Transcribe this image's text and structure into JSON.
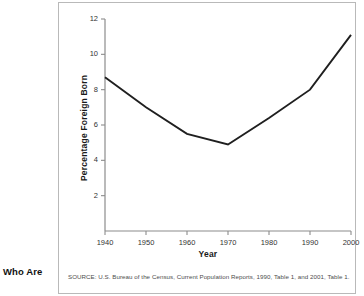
{
  "page": {
    "side_caption": "Who Are"
  },
  "figure": {
    "source_note": "SOURCE: U.S. Bureau of the Census, Current Population Reports, 1990, Table 1, and 2001, Table 1."
  },
  "chart_data": {
    "type": "line",
    "title": "",
    "xlabel": "Year",
    "ylabel": "Percentage Foreign Born",
    "x": [
      1940,
      1950,
      1960,
      1970,
      1980,
      1990,
      2000
    ],
    "values": [
      8.7,
      7.0,
      5.5,
      4.9,
      6.4,
      8.0,
      11.1
    ],
    "series": [
      {
        "name": "Percentage Foreign Born",
        "values": [
          8.7,
          7.0,
          5.5,
          4.9,
          6.4,
          8.0,
          11.1
        ]
      }
    ],
    "xlim": [
      1940,
      2000
    ],
    "ylim": [
      0,
      12
    ],
    "xticks": [
      1940,
      1950,
      1960,
      1970,
      1980,
      1990,
      2000
    ],
    "xtick_labels": [
      "1940",
      "1950",
      "1960",
      "1970",
      "1980",
      "1990",
      "2000"
    ],
    "yticks": [
      2,
      4,
      6,
      8,
      10,
      12
    ],
    "ytick_labels": [
      "2",
      "4",
      "6",
      "8",
      "10",
      "12"
    ],
    "grid": false,
    "legend": "none",
    "line_color": "#1f1f1f",
    "axis_color": "#8c8c8c"
  }
}
